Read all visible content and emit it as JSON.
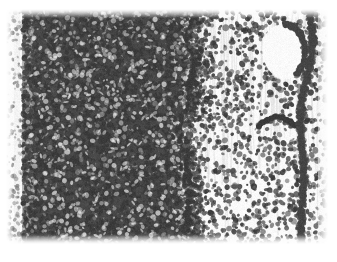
{
  "figure": {
    "kind": "photomicrograph",
    "modality": "light-microscopy-histology-section",
    "stain": "hematoxylin-eosin-grayscale",
    "caption": "",
    "title": "",
    "label": "",
    "scale_bar": "",
    "magnification": ""
  },
  "canvas": {
    "width": 337,
    "height": 262,
    "page_background": "#ffffff",
    "plate": {
      "left": 6,
      "top": 9,
      "width": 322,
      "height": 235
    }
  },
  "palette": {
    "page_white": "#ffffff",
    "plate_background": "#fbfbfb",
    "sparse_background": "#f4f4f4",
    "dense_mid_gray": "#8d8d8d",
    "dense_dark_gray": "#4a4a4a",
    "nucleus_dark": "#3a3a3a",
    "nucleus_mid": "#5c5c5c",
    "streak_gray": "#dcdcdc",
    "lumen_white": "#fcfcfc",
    "band_dark": "#454545"
  },
  "regions": [
    {
      "name": "left-margin-strip",
      "description": "narrow pale band with a few scattered nuclei at the very left edge of the section",
      "x0": 6,
      "x1": 27,
      "y0": 9,
      "y1": 244,
      "cell_density": "very-low",
      "mean_gray": "#efefef"
    },
    {
      "name": "dense-cellular-field",
      "description": "broad densely packed, almost confluent dark nuclei occupying the left two thirds",
      "x0": 27,
      "x1": 190,
      "y0": 9,
      "y1": 244,
      "cell_density": "very-high",
      "mean_gray": "#7b7b7b"
    },
    {
      "name": "transition-zone",
      "description": "ragged vertical boundary where nuclear density drops abruptly",
      "x0": 178,
      "x1": 200,
      "y0": 9,
      "y1": 244,
      "cell_density": "gradient-high-to-low",
      "mean_gray": "#b8b8b8"
    },
    {
      "name": "sparse-cellular-field",
      "description": "pale field with evenly scattered discrete dark nuclei on faint fibrous streaking",
      "x0": 190,
      "x1": 328,
      "y0": 9,
      "y1": 244,
      "cell_density": "low",
      "mean_gray": "#ededed"
    },
    {
      "name": "lumen-space",
      "description": "pale rounded empty space in the upper right, rimmed by a condensed arc of nuclei",
      "x0": 262,
      "x1": 305,
      "y0": 24,
      "y1": 80,
      "cell_density": "none",
      "mean_gray": "#fbfbfb"
    },
    {
      "name": "small-curved-structure",
      "description": "short curved chain of nuclei in the mid right field",
      "x0": 258,
      "x1": 296,
      "y0": 118,
      "y1": 142,
      "cell_density": "moderate",
      "mean_gray": "#8a8a8a"
    },
    {
      "name": "right-vertical-band",
      "description": "dark vertical condensation of nuclei running down the right side of the section",
      "x0": 298,
      "x1": 318,
      "y0": 9,
      "y1": 244,
      "cell_density": "high",
      "mean_gray": "#6a6a6a"
    }
  ],
  "texture_seed": 20240517,
  "generation": {
    "dense_nuclei_count": 15000,
    "sparse_nuclei_count": 1250,
    "band_nuclei_count": 900,
    "rim_nuclei_count": 420,
    "nucleus_radius_px": [
      1.1,
      2.6
    ],
    "streak_count": 70
  }
}
